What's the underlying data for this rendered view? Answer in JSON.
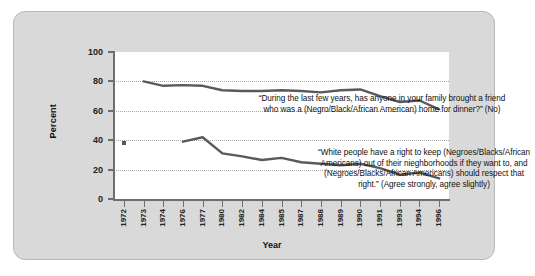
{
  "chart_data": {
    "type": "line",
    "title": "",
    "xlabel": "Year",
    "ylabel": "Percent",
    "ylim": [
      0,
      100
    ],
    "yticks": [
      0,
      20,
      40,
      60,
      80,
      100
    ],
    "gridlines": [
      20,
      40,
      60,
      80
    ],
    "grid": true,
    "legend": "none",
    "categories": [
      "1972",
      "1973",
      "1974",
      "1976",
      "1977",
      "1980",
      "1982",
      "1984",
      "1985",
      "1987",
      "1988",
      "1989",
      "1990",
      "1991",
      "1993",
      "1994",
      "1996"
    ],
    "series": [
      {
        "name": "“During the last few years, has anyone in your family brought a friend who was a (Negro/Black/African American) home for dinner?” (No)",
        "values": [
          null,
          80,
          77,
          77.5,
          77,
          74,
          73.5,
          73.5,
          74,
          73.5,
          72.5,
          74,
          74.5,
          70,
          66,
          67,
          61
        ]
      },
      {
        "name": "“White people have a right to keep (Negroes/Blacks/African Americans) out of their nieghborhoods if they want to, and (Negroes/Blacks/African Americans) should respect that right.” (Agree strongly, agree slightly)",
        "values": [
          null,
          null,
          null,
          39,
          42,
          31,
          29,
          26.5,
          28,
          25,
          24,
          23,
          24,
          21,
          16.5,
          18,
          14
        ]
      }
    ],
    "markers": [
      {
        "label": "1972-point",
        "x": "1972",
        "y": 38
      }
    ],
    "annotations": [
      {
        "id": "annotation-upper",
        "lines": [
          "“During the last few years, has anyone in your family brought a friend",
          "who was a (Negro/Black/African American) home for dinner?” (No)"
        ]
      },
      {
        "id": "annotation-lower",
        "lines": [
          "“White people have a right to keep (Negroes/Blacks/African",
          "Americans) out of their nieghborhoods if they want to, and",
          "(Negroes/Blacks/African Americans) should respect that",
          "right.” (Agree strongly, agree slightly)"
        ]
      }
    ],
    "colors": {
      "panel": "#d9d9d9",
      "plot_background": "#ffffff",
      "axis": "#6e6e6e",
      "gridline": "#a8a8a8",
      "series_line": "#5a5a5a",
      "text": "#111111"
    }
  }
}
